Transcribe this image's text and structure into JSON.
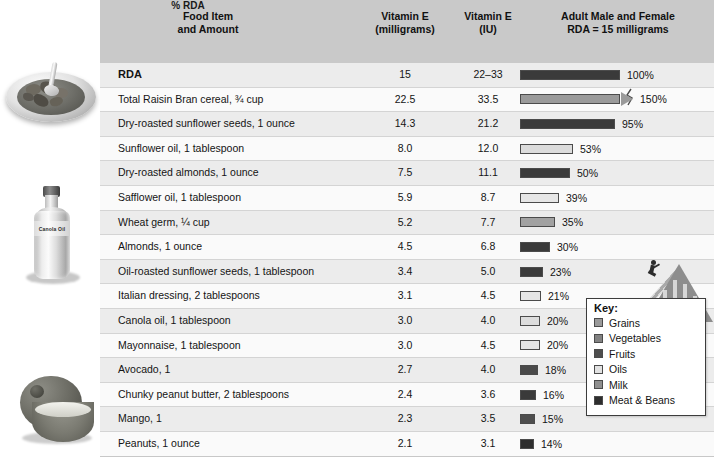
{
  "header": {
    "col_food": "Food Item\nand Amount",
    "col_food_line1": "Food Item",
    "col_food_line2": "and Amount",
    "col_mg_line1": "Vitamin E",
    "col_mg_line2": "(milligrams)",
    "col_iu_line1": "Vitamin E",
    "col_iu_line2": "(IU)",
    "col_rda_line1": "Adult Male and Female",
    "col_rda_line2": "RDA = 15 milligrams",
    "col_pct": "% RDA"
  },
  "legend": {
    "title": "Key:",
    "items": [
      {
        "label": "Grains",
        "color": "#9a9a9a"
      },
      {
        "label": "Vegetables",
        "color": "#828282"
      },
      {
        "label": "Fruits",
        "color": "#4e4e4e"
      },
      {
        "label": "Oils",
        "color": "#e2e2e2"
      },
      {
        "label": "Milk",
        "color": "#8f8f8f"
      },
      {
        "label": "Meat & Beans",
        "color": "#2e2e2e"
      }
    ]
  },
  "illustrations": {
    "cereal_bowl": "cereal-bowl",
    "oil_bottle_label": "Canola Oil",
    "avocado": "avocado"
  },
  "chart_data": {
    "type": "bar",
    "xlabel": "% RDA",
    "ylabel": "Food Item and Amount",
    "xlim": [
      0,
      100
    ],
    "grid": false,
    "legend_position": "lower-right",
    "columns": [
      "Food Item and Amount",
      "Vitamin E (milligrams)",
      "Vitamin E (IU)",
      "% RDA"
    ],
    "rows": [
      {
        "food": "RDA",
        "mg": "15",
        "iu": "22–33",
        "pct": 100,
        "pct_label": "100%",
        "group": "Meat & Beans",
        "color": "#3a3a3a",
        "bold": true,
        "overflow": false
      },
      {
        "food": "Total Raisin Bran cereal, ¾ cup",
        "mg": "22.5",
        "iu": "33.5",
        "pct": 150,
        "pct_label": "150%",
        "group": "Grains",
        "color": "#9a9a9a",
        "bold": false,
        "overflow": true
      },
      {
        "food": "Dry-roasted sunflower seeds, 1 ounce",
        "mg": "14.3",
        "iu": "21.2",
        "pct": 95,
        "pct_label": "95%",
        "group": "Meat & Beans",
        "color": "#3a3a3a",
        "bold": false,
        "overflow": false
      },
      {
        "food": "Sunflower oil, 1 tablespoon",
        "mg": "8.0",
        "iu": "12.0",
        "pct": 53,
        "pct_label": "53%",
        "group": "Oils",
        "color": "#dcdcdc",
        "bold": false,
        "overflow": false
      },
      {
        "food": "Dry-roasted almonds, 1 ounce",
        "mg": "7.5",
        "iu": "11.1",
        "pct": 50,
        "pct_label": "50%",
        "group": "Meat & Beans",
        "color": "#3a3a3a",
        "bold": false,
        "overflow": false
      },
      {
        "food": "Safflower oil, 1 tablespoon",
        "mg": "5.9",
        "iu": "8.7",
        "pct": 39,
        "pct_label": "39%",
        "group": "Oils",
        "color": "#e6e6e6",
        "bold": false,
        "overflow": false
      },
      {
        "food": "Wheat germ, ¼ cup",
        "mg": "5.2",
        "iu": "7.7",
        "pct": 35,
        "pct_label": "35%",
        "group": "Grains",
        "color": "#a2a2a2",
        "bold": false,
        "overflow": false
      },
      {
        "food": "Almonds, 1 ounce",
        "mg": "4.5",
        "iu": "6.8",
        "pct": 30,
        "pct_label": "30%",
        "group": "Meat & Beans",
        "color": "#3a3a3a",
        "bold": false,
        "overflow": false
      },
      {
        "food": "Oil-roasted sunflower seeds, 1 tablespoon",
        "mg": "3.4",
        "iu": "5.0",
        "pct": 23,
        "pct_label": "23%",
        "group": "Meat & Beans",
        "color": "#3a3a3a",
        "bold": false,
        "overflow": false
      },
      {
        "food": "Italian dressing, 2 tablespoons",
        "mg": "3.1",
        "iu": "4.5",
        "pct": 21,
        "pct_label": "21%",
        "group": "Oils",
        "color": "#e6e6e6",
        "bold": false,
        "overflow": false
      },
      {
        "food": "Canola oil, 1 tablespoon",
        "mg": "3.0",
        "iu": "4.0",
        "pct": 20,
        "pct_label": "20%",
        "group": "Oils",
        "color": "#dcdcdc",
        "bold": false,
        "overflow": false
      },
      {
        "food": "Mayonnaise, 1 tablespoon",
        "mg": "3.0",
        "iu": "4.5",
        "pct": 20,
        "pct_label": "20%",
        "group": "Oils",
        "color": "#e6e6e6",
        "bold": false,
        "overflow": false
      },
      {
        "food": "Avocado, 1",
        "mg": "2.7",
        "iu": "4.0",
        "pct": 18,
        "pct_label": "18%",
        "group": "Fruits",
        "color": "#4a4a4a",
        "bold": false,
        "overflow": false
      },
      {
        "food": "Chunky peanut butter, 2 tablespoons",
        "mg": "2.4",
        "iu": "3.6",
        "pct": 16,
        "pct_label": "16%",
        "group": "Meat & Beans",
        "color": "#3a3a3a",
        "bold": false,
        "overflow": false
      },
      {
        "food": "Mango, 1",
        "mg": "2.3",
        "iu": "3.5",
        "pct": 15,
        "pct_label": "15%",
        "group": "Fruits",
        "color": "#4e4e4e",
        "bold": false,
        "overflow": false
      },
      {
        "food": "Peanuts, 1 ounce",
        "mg": "2.1",
        "iu": "3.1",
        "pct": 14,
        "pct_label": "14%",
        "group": "Meat & Beans",
        "color": "#2e2e2e",
        "bold": false,
        "overflow": false
      }
    ]
  }
}
